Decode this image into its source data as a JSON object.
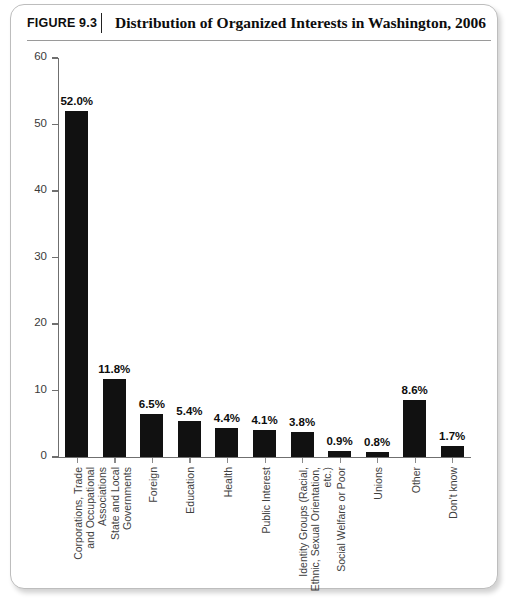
{
  "figure": {
    "number_label": "FIGURE 9.3",
    "title": "Distribution of Organized Interests in Washington, 2006"
  },
  "colors": {
    "bar": "#111111",
    "axis": "#6f6f6f",
    "frame": "#bdbdbd",
    "text": "#0d0d0d"
  },
  "chart_data": {
    "type": "bar",
    "title": "Distribution of Organized Interests in Washington, 2006",
    "xlabel": "",
    "ylabel": "",
    "ylim": [
      0,
      60
    ],
    "yticks": [
      0,
      10,
      20,
      30,
      40,
      50,
      60
    ],
    "grid": false,
    "legend": "none",
    "value_label_suffix": "%",
    "categories": [
      "Corporations, Trade and Occupational Associations",
      "State and Local Governments",
      "Foreign",
      "Education",
      "Health",
      "Public Interest",
      "Identity Groups (Racial, Ethnic, Sexual Orientation, etc.)",
      "Social Welfare or Poor",
      "Unions",
      "Other",
      "Don't know"
    ],
    "category_lines": [
      "Corporations, Trade\nand Occupational\nAssociations",
      "State and Local\nGovernments",
      "Foreign",
      "Education",
      "Health",
      "Public Interest",
      "Identity Groups (Racial,\nEthnic, Sexual Orientation,\netc.)",
      "Social Welfare or Poor",
      "Unions",
      "Other",
      "Don't know"
    ],
    "values": [
      52.0,
      11.8,
      6.5,
      5.4,
      4.4,
      4.1,
      3.8,
      0.9,
      0.8,
      8.6,
      1.7
    ],
    "value_labels": [
      "52.0%",
      "11.8%",
      "6.5%",
      "5.4%",
      "4.4%",
      "4.1%",
      "3.8%",
      "0.9%",
      "0.8%",
      "8.6%",
      "1.7%"
    ]
  }
}
